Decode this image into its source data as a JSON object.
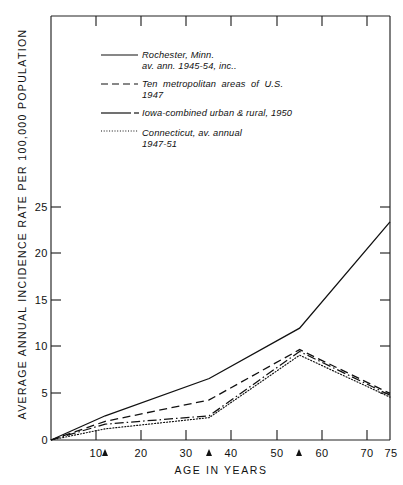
{
  "chart_data": {
    "type": "line",
    "title": "",
    "xlabel": "AGE  IN  YEARS",
    "ylabel": "AVERAGE  ANNUAL  INCIDENCE  RATE  PER  100,000  POPULATION",
    "xlim": [
      0,
      75
    ],
    "ylim": [
      0,
      28
    ],
    "xticks": [
      10,
      20,
      30,
      40,
      50,
      60,
      70,
      75
    ],
    "yticks": [
      0,
      5,
      10,
      15,
      20,
      25
    ],
    "grid": false,
    "legend_position": "upper-left-inside",
    "axis_arrows": [
      12,
      35,
      55
    ],
    "series": [
      {
        "name": "Rochester, Minn. av. ann. 1945-54, inc.",
        "legend_line1": "Rochester, Minn.",
        "legend_line2": "av. ann. 1945-54, inc..",
        "style": "solid",
        "x": [
          0,
          12,
          35,
          55,
          75
        ],
        "y": [
          0,
          2.6,
          6.6,
          12.0,
          23.4
        ]
      },
      {
        "name": "Ten metropolitan areas of U.S. 1947",
        "legend_line1": "Ten  metropolitan  areas  of  U.S.",
        "legend_line2": "1947",
        "style": "dashed",
        "x": [
          0,
          12,
          35,
          55,
          75
        ],
        "y": [
          0,
          2.0,
          4.3,
          9.7,
          5.0
        ]
      },
      {
        "name": "Iowa-combined urban & rural, 1950",
        "legend_line1": "Iowa-combined urban & rural, 1950",
        "legend_line2": "",
        "style": "dash-dot",
        "x": [
          0,
          12,
          35,
          55,
          75
        ],
        "y": [
          0,
          1.7,
          2.6,
          9.5,
          4.8
        ]
      },
      {
        "name": "Connecticut, av. annual 1947-51",
        "legend_line1": "Connecticut, av. annual",
        "legend_line2": "1947-51",
        "style": "dotted",
        "x": [
          0,
          12,
          35,
          55,
          75
        ],
        "y": [
          0,
          1.2,
          2.4,
          9.1,
          4.6
        ]
      }
    ]
  },
  "axes": {
    "y_tick_labels": [
      "0",
      "5",
      "10",
      "15",
      "20",
      "25"
    ],
    "x_tick_labels": [
      "10",
      "20",
      "30",
      "40",
      "50",
      "60",
      "70",
      "75"
    ]
  }
}
